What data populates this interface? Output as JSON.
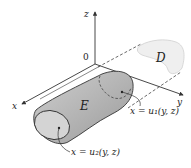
{
  "figure": {
    "type": "3D region diagram",
    "axes": {
      "x_label": "x",
      "y_label": "y",
      "z_label": "z",
      "origin_label": "0"
    },
    "regions": {
      "solid_label": "E",
      "projection_label": "D"
    },
    "surfaces": {
      "back": "x = u₁(y, z)",
      "front": "x = u₂(y, z)"
    },
    "colors": {
      "solid_fill": "#b8b8b8",
      "solid_end_cap": "#d2d2d2",
      "projection_fill": "#efefef",
      "axis_stroke": "#333333",
      "dashed_stroke": "#444444"
    }
  }
}
